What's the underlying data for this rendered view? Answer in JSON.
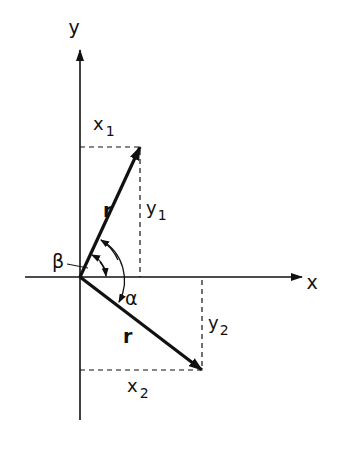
{
  "diagram": {
    "axes": {
      "x_label": "x",
      "y_label": "y"
    },
    "vector1": {
      "label": "r",
      "x_component": {
        "base": "x",
        "sub": "1"
      },
      "y_component": {
        "base": "y",
        "sub": "1"
      }
    },
    "vector2": {
      "label": "r",
      "x_component": {
        "base": "x",
        "sub": "2"
      },
      "y_component": {
        "base": "y",
        "sub": "2"
      }
    },
    "angles": {
      "beta": "β",
      "alpha": "α"
    },
    "colors": {
      "ink": "#111111",
      "background": "#ffffff"
    }
  }
}
